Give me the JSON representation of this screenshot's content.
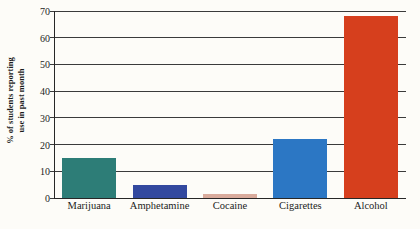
{
  "chart_data": {
    "type": "bar",
    "title": "",
    "xlabel": "",
    "ylabel": "% of students reporting use in past month",
    "ylabel_line1": "% of students reporting",
    "ylabel_line2": "use in past month",
    "categories": [
      "Marijuana",
      "Amphetamine",
      "Cocaine",
      "Cigarettes",
      "Alcohol"
    ],
    "values": [
      15,
      5,
      1.5,
      22,
      68
    ],
    "bar_colors": [
      "#2d7d77",
      "#33499f",
      "#d9ab9c",
      "#2c77c4",
      "#d63f1d"
    ],
    "ylim": [
      0,
      70
    ],
    "yticks": [
      0,
      10,
      20,
      30,
      40,
      50,
      60,
      70
    ],
    "ytick_labels": [
      "0",
      "10",
      "20",
      "30",
      "40",
      "50",
      "60",
      "70"
    ],
    "grid": true,
    "grid_axis": "y",
    "legend": false,
    "legend_position": "none"
  },
  "style": {
    "background": "#fdfcf8",
    "axis_color": "#272727",
    "grid_color": "#3b3b3b",
    "text_color": "#1c1c1c"
  }
}
